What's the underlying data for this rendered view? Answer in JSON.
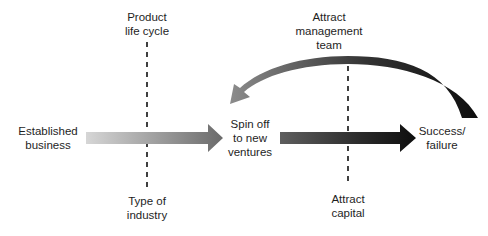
{
  "diagram": {
    "nodes": {
      "product_life_cycle": {
        "lines": [
          "Product",
          "life cycle"
        ]
      },
      "attract_management_team": {
        "lines": [
          "Attract",
          "management",
          "team"
        ]
      },
      "established_business": {
        "lines": [
          "Established",
          "business"
        ]
      },
      "spin_off": {
        "lines": [
          "Spin off",
          "to new",
          "ventures"
        ]
      },
      "success_failure": {
        "lines": [
          "Success/",
          "failure"
        ]
      },
      "type_of_industry": {
        "lines": [
          "Type of",
          "industry"
        ]
      },
      "attract_capital": {
        "lines": [
          "Attract",
          "capital"
        ]
      }
    },
    "edges": [
      {
        "from": "Established business",
        "to": "Spin off to new ventures",
        "style": "gradient light-to-mid gray arrow"
      },
      {
        "from": "Spin off to new ventures",
        "to": "Success/failure",
        "style": "gradient dark gray-to-black arrow"
      },
      {
        "from": "Success/failure",
        "to": "Spin off to new ventures",
        "style": "curved feedback arrow, black-to-gray"
      }
    ],
    "influences": [
      {
        "axis": "left-dashed-line",
        "top": "Product life cycle",
        "bottom": "Type of industry"
      },
      {
        "axis": "right-dashed-line",
        "top": "Attract management team",
        "bottom": "Attract capital"
      }
    ],
    "colors": {
      "arrow1_start": "#d4d4d4",
      "arrow1_end": "#6e6e6e",
      "arrow2_start": "#5a5a5a",
      "arrow2_end": "#111111",
      "curve_start": "#111111",
      "curve_end": "#8a8a8a",
      "dash": "#111111",
      "text": "#1e1e1e"
    }
  }
}
